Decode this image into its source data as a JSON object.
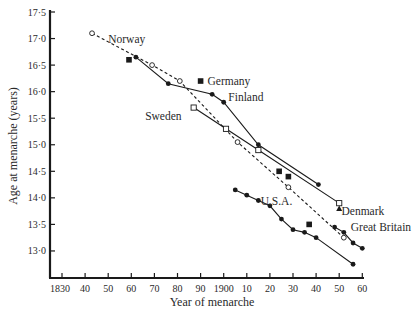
{
  "chart_data": {
    "type": "line",
    "title": "",
    "xlabel": "Year of menarche",
    "ylabel": "Age at menarche (years)",
    "xlim": [
      1830,
      1960
    ],
    "ylim": [
      12.5,
      17.5
    ],
    "grid": false,
    "x_ticks": [
      1830,
      1840,
      1850,
      1860,
      1870,
      1880,
      1890,
      1900,
      1910,
      1920,
      1930,
      1940,
      1950,
      1960
    ],
    "x_tick_labels": [
      "1830",
      "40",
      "50",
      "60",
      "70",
      "80",
      "90",
      "1900",
      "10",
      "20",
      "30",
      "40",
      "50",
      "60"
    ],
    "y_ticks": [
      13.0,
      13.5,
      14.0,
      14.5,
      15.0,
      15.5,
      16.0,
      16.5,
      17.0,
      17.5
    ],
    "y_tick_labels": [
      "13·0",
      "13·5",
      "14·0",
      "14·5",
      "15·0",
      "15·5",
      "16·0",
      "16·5",
      "17·0",
      "17·5"
    ],
    "legend": "inline labels",
    "series": [
      {
        "name": "Norway",
        "marker": "open-circle",
        "line": "dashed",
        "x": [
          1843,
          1869,
          1881,
          1906,
          1928,
          1952
        ],
        "y": [
          17.1,
          16.5,
          16.2,
          15.05,
          14.2,
          13.25
        ]
      },
      {
        "name": "Finland",
        "marker": "filled-circle",
        "line": "solid",
        "x": [
          1862,
          1876,
          1895,
          1900,
          1915,
          1941
        ],
        "y": [
          16.65,
          16.15,
          15.95,
          15.8,
          15.0,
          14.25
        ]
      },
      {
        "name": "Sweden",
        "marker": "open-square",
        "line": "solid",
        "x": [
          1887,
          1901,
          1915,
          1950
        ],
        "y": [
          15.7,
          15.3,
          14.9,
          13.9
        ]
      },
      {
        "name": "Denmark",
        "marker": "filled-triangle",
        "line": "none",
        "x": [
          1950
        ],
        "y": [
          13.8
        ]
      },
      {
        "name": "Germany",
        "marker": "filled-square",
        "line": "none",
        "x": [
          1859,
          1890,
          1924,
          1928,
          1937
        ],
        "y": [
          16.6,
          16.2,
          14.5,
          14.4,
          13.5
        ]
      },
      {
        "name": "U.S.A.",
        "marker": "filled-circle",
        "line": "solid",
        "x": [
          1905,
          1910,
          1915,
          1920,
          1925,
          1930,
          1935,
          1940,
          1956
        ],
        "y": [
          14.15,
          14.05,
          13.95,
          13.85,
          13.6,
          13.4,
          13.35,
          13.25,
          12.75
        ]
      },
      {
        "name": "Great Britain",
        "marker": "filled-circle",
        "line": "solid",
        "x": [
          1948,
          1952,
          1956,
          1960
        ],
        "y": [
          13.45,
          13.35,
          13.15,
          13.05
        ]
      }
    ],
    "annotations": [
      {
        "text": "Norway",
        "x": 1850,
        "y": 17.0
      },
      {
        "text": "Germany",
        "x": 1893,
        "y": 16.2
      },
      {
        "text": "Finland",
        "x": 1902,
        "y": 15.9
      },
      {
        "text": "Sweden",
        "x": 1866,
        "y": 15.55
      },
      {
        "text": "Denmark",
        "x": 1951,
        "y": 13.75
      },
      {
        "text": "U.S.A.",
        "x": 1916,
        "y": 13.95
      },
      {
        "text": "Great Britain",
        "x": 1955,
        "y": 13.45
      }
    ]
  }
}
